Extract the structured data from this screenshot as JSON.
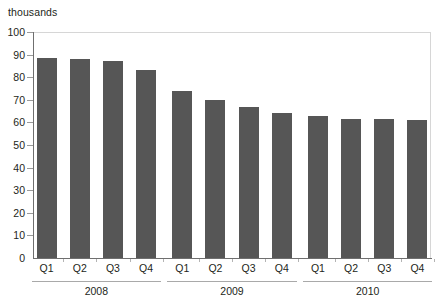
{
  "chart_data": {
    "type": "bar",
    "title": "",
    "subtitle": "",
    "unit_label": "thousands",
    "xlabel": "",
    "ylabel": "",
    "ylim": [
      0,
      100
    ],
    "ytick_step": 10,
    "yticks": [
      0,
      10,
      20,
      30,
      40,
      50,
      60,
      70,
      80,
      90,
      100
    ],
    "ytick_labels": [
      "0",
      "10",
      "20",
      "30",
      "40",
      "50",
      "60",
      "70",
      "80",
      "90",
      "100"
    ],
    "grid": false,
    "legend": null,
    "bar_color": "#565656",
    "axis_color": "#6f6f6f",
    "categories": [
      "Q1",
      "Q2",
      "Q3",
      "Q4",
      "Q1",
      "Q2",
      "Q3",
      "Q4",
      "Q1",
      "Q2",
      "Q3",
      "Q4"
    ],
    "values": [
      88.5,
      88,
      87,
      83,
      74,
      70,
      67,
      64,
      63,
      61.5,
      61.5,
      61
    ],
    "groups": [
      {
        "label": "2008",
        "start_index": 0,
        "end_index": 3
      },
      {
        "label": "2009",
        "start_index": 4,
        "end_index": 7
      },
      {
        "label": "2010",
        "start_index": 8,
        "end_index": 11
      }
    ],
    "series": [
      {
        "name": "",
        "values": [
          88.5,
          88,
          87,
          83,
          74,
          70,
          67,
          64,
          63,
          61.5,
          61.5,
          61
        ]
      }
    ]
  }
}
